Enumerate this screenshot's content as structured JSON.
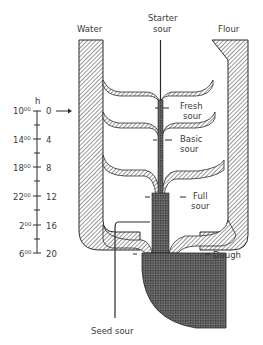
{
  "diagram": {
    "type": "process-flow",
    "inputs": {
      "water": "Water",
      "starter_line1": "Starter",
      "starter_line2": "sour",
      "flour": "Flour"
    },
    "stages": [
      {
        "line1": "Fresh",
        "line2": "sour"
      },
      {
        "line1": "Basic",
        "line2": "sour"
      },
      {
        "line1": "Full",
        "line2": "sour"
      }
    ],
    "output_dough": "Dough",
    "output_seed": "Seed sour",
    "timeline": {
      "unit": "h",
      "start_arrow": "→",
      "ticks": [
        {
          "clock": "10",
          "clock_sup": "00",
          "hours": "0"
        },
        {
          "clock": "14",
          "clock_sup": "00",
          "hours": "4"
        },
        {
          "clock": "18",
          "clock_sup": "00",
          "hours": "8"
        },
        {
          "clock": "22",
          "clock_sup": "00",
          "hours": "12"
        },
        {
          "clock": "2",
          "clock_sup": "00",
          "hours": "16"
        },
        {
          "clock": "6",
          "clock_sup": "00",
          "hours": "20"
        }
      ]
    },
    "colors": {
      "line": "#2b2b2b",
      "text": "#3a3a3a",
      "background": "#ffffff"
    }
  }
}
